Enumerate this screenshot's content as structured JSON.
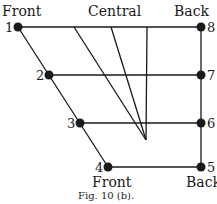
{
  "labels": {
    "top_left": "Front",
    "top_center": "Central",
    "top_right": "Back",
    "bottom_left": "Front",
    "bottom_right": "Back"
  },
  "caption": "Fig. 10 (b).",
  "points": [
    {
      "id": "1",
      "label": "1"
    },
    {
      "id": "2",
      "label": "2"
    },
    {
      "id": "3",
      "label": "3"
    },
    {
      "id": "4",
      "label": "4"
    },
    {
      "id": "5",
      "label": "5"
    },
    {
      "id": "6",
      "label": "6"
    },
    {
      "id": "7",
      "label": "7"
    },
    {
      "id": "8",
      "label": "8"
    }
  ],
  "colors": {
    "ink": "#1a1a1a",
    "background": "#ffffff"
  }
}
